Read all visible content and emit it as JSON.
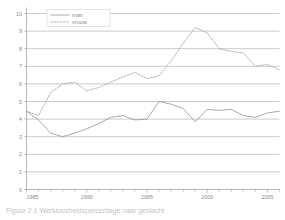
{
  "chart_data": {
    "type": "line",
    "title": "",
    "subtitle": "",
    "xlabel": "",
    "ylabel": "",
    "xlim": [
      1985,
      2006
    ],
    "ylim": [
      0,
      10
    ],
    "grid": true,
    "legend_position": "top-left",
    "y_ticks": [
      "0",
      "1",
      "2",
      "3",
      "4",
      "5",
      "6",
      "7",
      "8",
      "9",
      "10"
    ],
    "x_ticks": [
      "1985",
      "1990",
      "1995",
      "2000",
      "2005"
    ],
    "x_tick_values": [
      1985,
      1990,
      1995,
      2000,
      2005
    ],
    "x": [
      1985,
      1986,
      1987,
      1988,
      1989,
      1990,
      1991,
      1992,
      1993,
      1994,
      1995,
      1996,
      1997,
      1998,
      1999,
      2000,
      2001,
      2002,
      2003,
      2004,
      2005,
      2006
    ],
    "series": [
      {
        "name": "man",
        "style": "solid",
        "color": "#8e8e8e",
        "values": [
          4.45,
          3.95,
          3.2,
          3.0,
          3.2,
          3.45,
          3.75,
          4.1,
          4.2,
          3.95,
          4.0,
          5.0,
          4.85,
          4.6,
          3.85,
          4.55,
          4.5,
          4.55,
          4.2,
          4.1,
          4.35,
          4.45
        ]
      },
      {
        "name": "vrouw",
        "style": "dotted",
        "color": "#a2a2a2",
        "values": [
          4.45,
          4.2,
          5.5,
          6.0,
          6.1,
          5.6,
          5.8,
          6.1,
          6.4,
          6.65,
          6.3,
          6.45,
          7.3,
          8.3,
          9.2,
          8.9,
          8.0,
          7.85,
          7.75,
          7.0,
          7.1,
          6.8
        ]
      }
    ]
  },
  "legend": {
    "items": [
      {
        "label": "man",
        "style": "solid"
      },
      {
        "label": "vrouw",
        "style": "dotted"
      }
    ]
  },
  "caption": {
    "text": "Figuur 2.1  Werkloosheidspercentage naar geslacht"
  }
}
